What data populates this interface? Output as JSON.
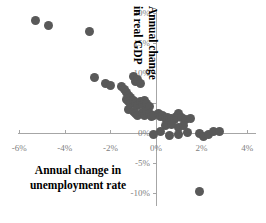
{
  "chart_data": {
    "type": "scatter",
    "title": "",
    "xlabel": "Annual change in unemployment rate",
    "ylabel": "Annual change in real GDP",
    "xlim": [
      -7,
      4.8
    ],
    "ylim": [
      -12,
      21
    ],
    "xticks": [
      "-6%",
      "-4%",
      "-2%",
      "0%",
      "2%",
      "4%"
    ],
    "xtick_values": [
      -6,
      -4,
      -2,
      0,
      2,
      4
    ],
    "yticks": [
      "20%",
      "15%",
      "10%",
      "5%",
      "0%",
      "-5%",
      "-10%"
    ],
    "ytick_values": [
      20,
      15,
      10,
      5,
      0,
      -5,
      -10
    ],
    "grid": false,
    "legend": "none",
    "marker_color": "#595959",
    "axis_color": "#a6a6a6",
    "tick_label_color": "#808080",
    "points": [
      {
        "x": -5.3,
        "y": 18.7
      },
      {
        "x": -4.7,
        "y": 18.0
      },
      {
        "x": -2.9,
        "y": 17.0
      },
      {
        "x": -2.7,
        "y": 9.2
      },
      {
        "x": -2.2,
        "y": 8.2
      },
      {
        "x": -2.0,
        "y": 8.0
      },
      {
        "x": -1.5,
        "y": 7.8
      },
      {
        "x": -1.4,
        "y": 7.2
      },
      {
        "x": -1.3,
        "y": 6.8
      },
      {
        "x": -1.2,
        "y": 6.3
      },
      {
        "x": -1.1,
        "y": 6.0
      },
      {
        "x": -1.0,
        "y": 9.5
      },
      {
        "x": -0.9,
        "y": 8.6
      },
      {
        "x": -0.8,
        "y": 9.0
      },
      {
        "x": -0.7,
        "y": 8.3
      },
      {
        "x": -1.3,
        "y": 5.6
      },
      {
        "x": -1.2,
        "y": 5.2
      },
      {
        "x": -1.1,
        "y": 4.9
      },
      {
        "x": -1.0,
        "y": 5.4
      },
      {
        "x": -0.9,
        "y": 5.0
      },
      {
        "x": -0.8,
        "y": 4.6
      },
      {
        "x": -0.7,
        "y": 5.2
      },
      {
        "x": -0.6,
        "y": 4.8
      },
      {
        "x": -0.5,
        "y": 5.5
      },
      {
        "x": -0.4,
        "y": 5.0
      },
      {
        "x": -0.3,
        "y": 4.4
      },
      {
        "x": -1.2,
        "y": 4.0
      },
      {
        "x": -1.0,
        "y": 3.6
      },
      {
        "x": -0.9,
        "y": 3.3
      },
      {
        "x": -0.8,
        "y": 3.0
      },
      {
        "x": -0.6,
        "y": 3.4
      },
      {
        "x": -0.5,
        "y": 3.0
      },
      {
        "x": -0.4,
        "y": 3.6
      },
      {
        "x": -0.3,
        "y": 3.2
      },
      {
        "x": -0.2,
        "y": 2.8
      },
      {
        "x": -0.1,
        "y": 3.0
      },
      {
        "x": 0.1,
        "y": 3.2
      },
      {
        "x": 0.2,
        "y": 2.7
      },
      {
        "x": 0.3,
        "y": 2.9
      },
      {
        "x": 0.4,
        "y": 2.4
      },
      {
        "x": 0.5,
        "y": 2.6
      },
      {
        "x": 0.6,
        "y": 2.2
      },
      {
        "x": 0.7,
        "y": 2.5
      },
      {
        "x": 0.8,
        "y": 2.3
      },
      {
        "x": 0.9,
        "y": 2.8
      },
      {
        "x": 1.0,
        "y": 3.2
      },
      {
        "x": 1.1,
        "y": 2.6
      },
      {
        "x": 1.3,
        "y": 2.2
      },
      {
        "x": 1.5,
        "y": 2.4
      },
      {
        "x": 0.4,
        "y": 1.2
      },
      {
        "x": 0.7,
        "y": 1.4
      },
      {
        "x": 1.0,
        "y": 1.0
      },
      {
        "x": 1.2,
        "y": 1.3
      },
      {
        "x": 0.2,
        "y": 0.2
      },
      {
        "x": 0.6,
        "y": -0.4
      },
      {
        "x": 1.0,
        "y": -0.3
      },
      {
        "x": 1.4,
        "y": 0.1
      },
      {
        "x": 1.9,
        "y": 0.0
      },
      {
        "x": 2.1,
        "y": -0.5
      },
      {
        "x": 2.3,
        "y": -0.2
      },
      {
        "x": 2.5,
        "y": 0.2
      },
      {
        "x": 2.8,
        "y": 0.3
      },
      {
        "x": -0.1,
        "y": -0.3
      },
      {
        "x": 1.9,
        "y": -9.8
      }
    ]
  },
  "axis": {
    "x_title_line1": "Annual change in",
    "x_title_line2": "unemployment rate",
    "y_title_line1": "Annual change",
    "y_title_line2": "in real GDP"
  }
}
